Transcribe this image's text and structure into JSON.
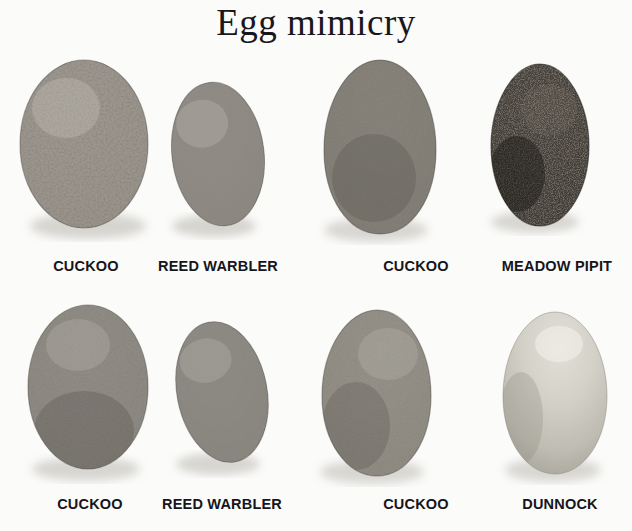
{
  "figure": {
    "title": "Egg mimicry",
    "background_color": "#fbfbfa",
    "text_color": "#16151a",
    "width": 632,
    "height": 531
  },
  "pairs": [
    {
      "id": "pair-reed-warbler-top",
      "parasite": {
        "label": "CUCKOO",
        "role": "parasite",
        "shape": "ovoid",
        "base_color": "#9a968f",
        "spot_color": "#3b3630",
        "pattern": "heavily-blotched",
        "size": "large"
      },
      "host": {
        "label": "REED WARBLER",
        "role": "host",
        "shape": "ovoid",
        "base_color": "#8d8a83",
        "spot_color": "#46423c",
        "pattern": "densely-mottled",
        "size": "small"
      }
    },
    {
      "id": "pair-meadow-pipit",
      "parasite": {
        "label": "CUCKOO",
        "role": "parasite",
        "shape": "ovoid",
        "base_color": "#827e77",
        "spot_color": "#35312c",
        "pattern": "densely-mottled",
        "size": "large"
      },
      "host": {
        "label": "MEADOW PIPIT",
        "role": "host",
        "shape": "ovoid",
        "base_color": "#4a453f",
        "spot_color": "#1d1a17",
        "pattern": "dark-dense-mottled",
        "size": "medium"
      }
    },
    {
      "id": "pair-reed-warbler-bottom",
      "parasite": {
        "label": "CUCKOO",
        "role": "parasite",
        "shape": "ovoid",
        "base_color": "#8e8a83",
        "spot_color": "#3a362f",
        "pattern": "densely-mottled",
        "size": "large"
      },
      "host": {
        "label": "REED WARBLER",
        "role": "host",
        "shape": "ovoid",
        "base_color": "#8a8780",
        "spot_color": "#403c36",
        "pattern": "densely-mottled",
        "size": "small"
      }
    },
    {
      "id": "pair-dunnock",
      "parasite": {
        "label": "CUCKOO",
        "role": "parasite",
        "shape": "ovoid",
        "base_color": "#959189",
        "spot_color": "#474views",
        "pattern": "finely-speckled",
        "size": "large"
      },
      "host": {
        "label": "DUNNOCK",
        "role": "host",
        "shape": "ovoid",
        "base_color": "#cfcdc4",
        "spot_color": "#b6b3a9",
        "pattern": "plain-unmarked",
        "size": "medium"
      }
    }
  ],
  "captions": {
    "row1": [
      "CUCKOO",
      "REED WARBLER",
      "CUCKOO",
      "MEADOW PIPIT"
    ],
    "row2": [
      "CUCKOO",
      "REED WARBLER",
      "CUCKOO",
      "DUNNOCK"
    ]
  }
}
